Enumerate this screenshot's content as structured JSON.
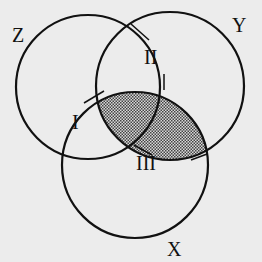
{
  "diagram": {
    "type": "venn",
    "sets": [
      {
        "name": "Z",
        "label": "Z",
        "cx": 88,
        "cy": 87,
        "r": 72,
        "label_x": 12,
        "label_y": 42
      },
      {
        "name": "Y",
        "label": "Y",
        "cx": 170,
        "cy": 86,
        "r": 74,
        "label_x": 232,
        "label_y": 32
      },
      {
        "name": "X",
        "label": "X",
        "cx": 135,
        "cy": 165,
        "r": 73,
        "label_x": 167,
        "label_y": 256
      }
    ],
    "regions": [
      {
        "label": "I",
        "x": 72,
        "y": 129
      },
      {
        "label": "II",
        "x": 144,
        "y": 64
      },
      {
        "label": "III",
        "x": 136,
        "y": 170
      }
    ],
    "shaded_region": "X ∩ Y",
    "colors": {
      "background": "#ececec",
      "stroke": "#111111",
      "shade": "#888888"
    }
  }
}
